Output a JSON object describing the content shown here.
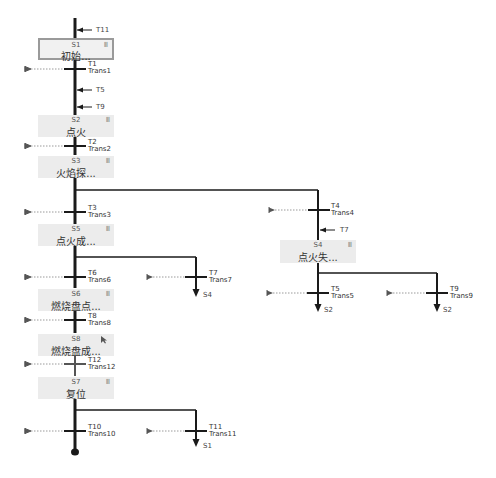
{
  "steps": {
    "S1": {
      "id": "S1",
      "name": "初始...",
      "icon": "III"
    },
    "S2": {
      "id": "S2",
      "name": "点火",
      "icon": "III"
    },
    "S3": {
      "id": "S3",
      "name": "火焰探...",
      "icon": "III"
    },
    "S5": {
      "id": "S5",
      "name": "点火成...",
      "icon": "III"
    },
    "S6": {
      "id": "S6",
      "name": "燃烧盘点...",
      "icon": "III"
    },
    "S8": {
      "id": "S8",
      "name": "燃烧盘成...",
      "icon": "III"
    },
    "S7": {
      "id": "S7",
      "name": "复位",
      "icon": "III"
    },
    "S4": {
      "id": "S4",
      "name": "点火失...",
      "icon": "III"
    }
  },
  "transitions": {
    "T1": {
      "id": "T1",
      "name": "Trans1"
    },
    "T2": {
      "id": "T2",
      "name": "Trans2"
    },
    "T3": {
      "id": "T3",
      "name": "Trans3"
    },
    "T4": {
      "id": "T4",
      "name": "Trans4"
    },
    "T5": {
      "id": "T5",
      "name": "Trans5"
    },
    "T6": {
      "id": "T6",
      "name": "Trans6"
    },
    "T7": {
      "id": "T7",
      "name": "Trans7"
    },
    "T8": {
      "id": "T8",
      "name": "Trans8"
    },
    "T9": {
      "id": "T9",
      "name": "Trans9"
    },
    "T10": {
      "id": "T10",
      "name": "Trans10"
    },
    "T11": {
      "id": "T11",
      "name": "Trans11"
    },
    "T12": {
      "id": "T12",
      "name": "Trans12"
    }
  },
  "incoming_jumps": {
    "to_S1": "T11",
    "to_S2_a": "T5",
    "to_S2_b": "T9",
    "to_S4": "T7"
  },
  "jump_targets": {
    "T7": "S4",
    "T5": "S2",
    "T9": "S2",
    "T11": "S1"
  },
  "colors": {
    "line": "#1a1a1a",
    "step_bg": "#ececec",
    "step_border_active": "#9a9a9a",
    "dotted": "#9a9a9a"
  }
}
